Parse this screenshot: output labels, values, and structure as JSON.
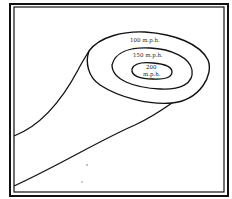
{
  "diagram": {
    "contours": [
      {
        "label_line1": "100 m.p.h.",
        "label_line2": ""
      },
      {
        "label_line1": "150 m.p.h.",
        "label_line2": ""
      },
      {
        "label_line1": "200",
        "label_line2": "m.p.h."
      }
    ]
  },
  "colors": {
    "line": "#111111",
    "background": "#ffffff"
  }
}
